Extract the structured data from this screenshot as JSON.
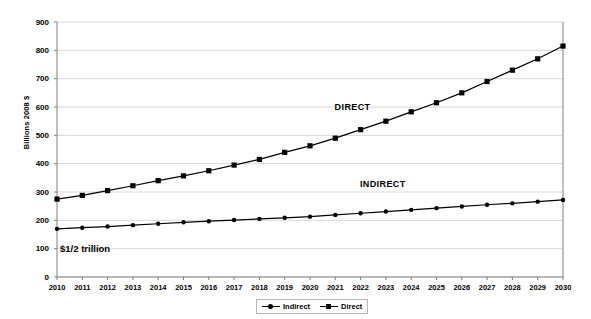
{
  "chart_data": {
    "type": "line",
    "title": "",
    "xlabel": "",
    "ylabel": "Billions 2008 $",
    "ylim": [
      0,
      900
    ],
    "ytick_step": 100,
    "yticks": [
      0,
      100,
      200,
      300,
      400,
      500,
      600,
      700,
      800,
      900
    ],
    "grid": true,
    "legend_position": "bottom-center",
    "categories": [
      "2010",
      "2011",
      "2012",
      "2013",
      "2014",
      "2015",
      "2016",
      "2017",
      "2018",
      "2019",
      "2020",
      "2021",
      "2022",
      "2023",
      "2024",
      "2025",
      "2026",
      "2027",
      "2028",
      "2029",
      "2030"
    ],
    "series": [
      {
        "name": "Indirect",
        "marker": "circle",
        "values": [
          170,
          174,
          178,
          183,
          188,
          193,
          197,
          201,
          205,
          209,
          213,
          219,
          225,
          231,
          237,
          243,
          249,
          255,
          260,
          266,
          272
        ]
      },
      {
        "name": "Direct",
        "marker": "square",
        "values": [
          275,
          288,
          305,
          322,
          340,
          357,
          375,
          395,
          415,
          440,
          463,
          490,
          520,
          550,
          583,
          615,
          650,
          690,
          730,
          770,
          815
        ]
      }
    ],
    "annotations": [
      {
        "text": "DIRECT",
        "x": "2022",
        "y": 595
      },
      {
        "text": "INDIRECT",
        "x": "2023",
        "y": 325
      },
      {
        "text": "$1/2 trillion",
        "x": "2010",
        "y": 100
      }
    ]
  },
  "legend": {
    "items": [
      {
        "label": "Indirect",
        "marker": "circle"
      },
      {
        "label": "Direct",
        "marker": "square"
      }
    ]
  },
  "colors": {
    "series": "#000000",
    "grid": "#d9d9d9",
    "axis": "#808080",
    "background": "#ffffff"
  }
}
